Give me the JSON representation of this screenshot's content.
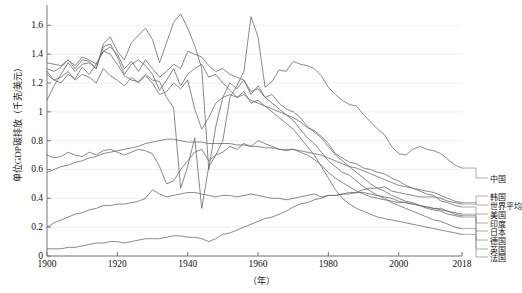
{
  "chart_data": {
    "type": "line",
    "title": "",
    "xlabel": "（年）",
    "ylabel": "单位GDP碳排放（千克/美元）",
    "xlim": [
      1900,
      2018
    ],
    "ylim": [
      0,
      1.72
    ],
    "grid": true,
    "legend_position": "right",
    "xticks": [
      "1900",
      "1920",
      "1940",
      "1960",
      "1980",
      "2000",
      "2018"
    ],
    "xtick_values": [
      1900,
      1920,
      1940,
      1960,
      1980,
      2000,
      2018
    ],
    "yticks": [
      "0",
      "0.2",
      "0.4",
      "0.6",
      "0.8",
      "1",
      "1.2",
      "1.4",
      "1.6"
    ],
    "ytick_values": [
      0,
      0.2,
      0.4,
      0.6,
      0.8,
      1,
      1.2,
      1.4,
      1.6
    ],
    "line_color": "#6b6b6b",
    "grid_color": "#f0f0f0",
    "axis_color": "#777777",
    "x": [
      1900,
      1902,
      1904,
      1906,
      1908,
      1910,
      1912,
      1914,
      1916,
      1918,
      1920,
      1922,
      1924,
      1926,
      1928,
      1930,
      1932,
      1934,
      1936,
      1938,
      1940,
      1942,
      1944,
      1946,
      1948,
      1950,
      1952,
      1954,
      1956,
      1958,
      1960,
      1962,
      1964,
      1966,
      1968,
      1970,
      1972,
      1974,
      1976,
      1978,
      1980,
      1982,
      1984,
      1986,
      1988,
      1990,
      1992,
      1994,
      1996,
      1998,
      2000,
      2002,
      2004,
      2006,
      2008,
      2010,
      2012,
      2014,
      2016,
      2018
    ],
    "series": [
      {
        "name": "中国",
        "label": "中国",
        "values": [
          1.28,
          1.22,
          1.2,
          1.26,
          1.23,
          1.31,
          1.26,
          1.33,
          1.42,
          1.4,
          1.33,
          1.25,
          1.22,
          1.21,
          1.26,
          1.22,
          1.21,
          1.1,
          1.03,
          0.47,
          0.62,
          0.82,
          0.33,
          0.62,
          0.7,
          0.8,
          1.1,
          1.18,
          1.28,
          1.66,
          1.52,
          1.17,
          1.21,
          1.29,
          1.28,
          1.35,
          1.33,
          1.32,
          1.3,
          1.25,
          1.17,
          1.12,
          1.08,
          1.05,
          1.04,
          0.98,
          0.93,
          0.88,
          0.84,
          0.76,
          0.71,
          0.7,
          0.74,
          0.76,
          0.74,
          0.73,
          0.71,
          0.67,
          0.63,
          0.61
        ]
      },
      {
        "name": "韩国",
        "label": "韩国",
        "values": [
          0.05,
          0.05,
          0.05,
          0.06,
          0.06,
          0.07,
          0.08,
          0.09,
          0.09,
          0.1,
          0.1,
          0.09,
          0.1,
          0.11,
          0.12,
          0.12,
          0.12,
          0.13,
          0.14,
          0.14,
          0.13,
          0.13,
          0.12,
          0.1,
          0.12,
          0.15,
          0.16,
          0.18,
          0.2,
          0.22,
          0.24,
          0.26,
          0.27,
          0.29,
          0.31,
          0.34,
          0.36,
          0.37,
          0.39,
          0.4,
          0.42,
          0.42,
          0.43,
          0.43,
          0.44,
          0.46,
          0.47,
          0.47,
          0.48,
          0.45,
          0.44,
          0.43,
          0.42,
          0.41,
          0.41,
          0.41,
          0.4,
          0.38,
          0.37,
          0.36
        ]
      },
      {
        "name": "世界平均",
        "label": "世界平均",
        "values": [
          0.58,
          0.6,
          0.62,
          0.63,
          0.65,
          0.66,
          0.68,
          0.69,
          0.71,
          0.72,
          0.73,
          0.74,
          0.75,
          0.76,
          0.78,
          0.79,
          0.8,
          0.81,
          0.81,
          0.8,
          0.79,
          0.79,
          0.79,
          0.78,
          0.78,
          0.78,
          0.78,
          0.77,
          0.77,
          0.76,
          0.76,
          0.75,
          0.75,
          0.74,
          0.74,
          0.74,
          0.73,
          0.72,
          0.71,
          0.7,
          0.68,
          0.66,
          0.64,
          0.62,
          0.61,
          0.59,
          0.57,
          0.55,
          0.53,
          0.51,
          0.49,
          0.48,
          0.47,
          0.46,
          0.45,
          0.44,
          0.42,
          0.4,
          0.38,
          0.37
        ]
      },
      {
        "name": "美国",
        "label": "美国",
        "values": [
          1.08,
          1.18,
          1.26,
          1.34,
          1.28,
          1.33,
          1.34,
          1.3,
          1.45,
          1.47,
          1.38,
          1.26,
          1.33,
          1.36,
          1.32,
          1.26,
          1.15,
          1.22,
          1.3,
          1.18,
          1.26,
          1.3,
          1.33,
          1.24,
          1.26,
          1.2,
          1.15,
          1.1,
          1.12,
          1.08,
          1.06,
          1.04,
          1.02,
          1.0,
          0.98,
          0.96,
          0.93,
          0.89,
          0.87,
          0.83,
          0.78,
          0.71,
          0.68,
          0.65,
          0.64,
          0.61,
          0.6,
          0.58,
          0.57,
          0.54,
          0.52,
          0.49,
          0.47,
          0.45,
          0.43,
          0.42,
          0.38,
          0.37,
          0.35,
          0.34
        ]
      },
      {
        "name": "印度",
        "label": "印度",
        "values": [
          0.2,
          0.23,
          0.25,
          0.27,
          0.29,
          0.3,
          0.32,
          0.33,
          0.35,
          0.35,
          0.36,
          0.36,
          0.37,
          0.38,
          0.4,
          0.46,
          0.43,
          0.41,
          0.42,
          0.43,
          0.44,
          0.44,
          0.43,
          0.42,
          0.41,
          0.42,
          0.42,
          0.41,
          0.42,
          0.43,
          0.42,
          0.41,
          0.4,
          0.4,
          0.39,
          0.4,
          0.41,
          0.42,
          0.43,
          0.41,
          0.42,
          0.42,
          0.43,
          0.44,
          0.44,
          0.44,
          0.43,
          0.42,
          0.41,
          0.4,
          0.38,
          0.37,
          0.36,
          0.35,
          0.34,
          0.33,
          0.32,
          0.31,
          0.3,
          0.29
        ]
      },
      {
        "name": "日本",
        "label": "日本",
        "values": [
          0.7,
          0.68,
          0.69,
          0.72,
          0.7,
          0.69,
          0.72,
          0.7,
          0.73,
          0.74,
          0.72,
          0.7,
          0.72,
          0.74,
          0.73,
          0.71,
          0.62,
          0.5,
          0.52,
          0.6,
          0.66,
          0.72,
          0.74,
          0.66,
          0.7,
          0.72,
          0.76,
          0.74,
          0.78,
          0.76,
          0.8,
          0.78,
          0.76,
          0.74,
          0.73,
          0.74,
          0.72,
          0.7,
          0.67,
          0.63,
          0.58,
          0.54,
          0.51,
          0.48,
          0.45,
          0.43,
          0.41,
          0.4,
          0.39,
          0.38,
          0.37,
          0.37,
          0.36,
          0.35,
          0.34,
          0.33,
          0.33,
          0.31,
          0.29,
          0.28
        ]
      },
      {
        "name": "德国",
        "label": "德国",
        "values": [
          1.34,
          1.33,
          1.32,
          1.36,
          1.3,
          1.36,
          1.35,
          1.3,
          1.47,
          1.52,
          1.42,
          1.36,
          1.48,
          1.53,
          1.58,
          1.5,
          1.34,
          1.48,
          1.62,
          1.68,
          1.58,
          1.46,
          1.3,
          0.6,
          0.9,
          1.1,
          1.2,
          1.16,
          1.22,
          1.12,
          1.18,
          1.1,
          1.12,
          1.06,
          1.02,
          1.0,
          0.96,
          0.9,
          0.86,
          0.82,
          0.76,
          0.7,
          0.66,
          0.62,
          0.58,
          0.54,
          0.5,
          0.47,
          0.45,
          0.42,
          0.4,
          0.38,
          0.37,
          0.35,
          0.33,
          0.32,
          0.31,
          0.29,
          0.28,
          0.27
        ]
      },
      {
        "name": "英国",
        "label": "英国",
        "values": [
          1.3,
          1.28,
          1.31,
          1.36,
          1.32,
          1.38,
          1.36,
          1.33,
          1.42,
          1.45,
          1.4,
          1.3,
          1.35,
          1.28,
          1.36,
          1.3,
          1.24,
          1.28,
          1.33,
          1.3,
          1.42,
          1.4,
          1.38,
          1.32,
          1.28,
          1.3,
          1.26,
          1.24,
          1.22,
          1.14,
          1.16,
          1.1,
          1.06,
          1.02,
          0.98,
          0.94,
          0.88,
          0.82,
          0.78,
          0.72,
          0.66,
          0.62,
          0.58,
          0.56,
          0.52,
          0.48,
          0.45,
          0.42,
          0.4,
          0.37,
          0.35,
          0.33,
          0.31,
          0.29,
          0.27,
          0.25,
          0.24,
          0.22,
          0.2,
          0.19
        ]
      },
      {
        "name": "法国",
        "label": "法国",
        "values": [
          1.26,
          1.22,
          1.24,
          1.28,
          1.22,
          1.26,
          1.24,
          1.2,
          1.3,
          1.25,
          1.22,
          1.18,
          1.24,
          1.2,
          1.25,
          1.2,
          1.12,
          1.14,
          1.2,
          1.16,
          1.22,
          1.02,
          0.88,
          0.96,
          1.06,
          1.1,
          1.12,
          1.1,
          1.14,
          1.06,
          1.08,
          1.04,
          1.0,
          0.96,
          0.92,
          0.88,
          0.82,
          0.76,
          0.7,
          0.62,
          0.54,
          0.46,
          0.4,
          0.36,
          0.33,
          0.31,
          0.29,
          0.27,
          0.26,
          0.25,
          0.24,
          0.23,
          0.22,
          0.21,
          0.2,
          0.19,
          0.18,
          0.17,
          0.16,
          0.15
        ]
      }
    ],
    "legend_entries": [
      {
        "label": "中国",
        "y_value": 0.61
      },
      {
        "label": "韩国",
        "y_value": 0.36
      },
      {
        "label": "世界平均",
        "y_value": 0.37
      },
      {
        "label": "美国",
        "y_value": 0.34
      },
      {
        "label": "印度",
        "y_value": 0.29
      },
      {
        "label": "日本",
        "y_value": 0.28
      },
      {
        "label": "德国",
        "y_value": 0.27
      },
      {
        "label": "英国",
        "y_value": 0.19
      },
      {
        "label": "法国",
        "y_value": 0.15
      }
    ]
  }
}
